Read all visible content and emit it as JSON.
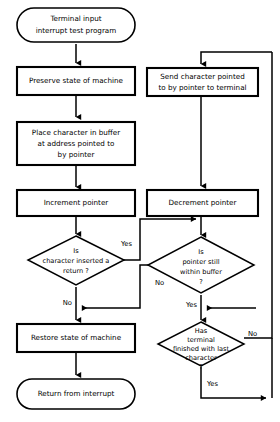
{
  "diagram": {
    "background_color": "#ffffff",
    "line_color": "#000000",
    "nodes": {
      "start": {
        "shape": "terminator",
        "line1": "Terminal input",
        "line2": "interrupt test program"
      },
      "preserve": {
        "shape": "process",
        "line1": "Preserve state of machine"
      },
      "place_char": {
        "shape": "process",
        "line1": "Place character in buffer",
        "line2": "at address pointed to",
        "line3": "by pointer"
      },
      "increment": {
        "shape": "process",
        "line1": "Increment pointer"
      },
      "is_return": {
        "shape": "decision",
        "line1": "Is",
        "line2": "character inserted a",
        "line3": "return ?"
      },
      "restore": {
        "shape": "process",
        "line1": "Restore state of machine"
      },
      "return_interrupt": {
        "shape": "terminator",
        "line1": "Return from interrupt"
      },
      "send_char": {
        "shape": "process",
        "line1": "Send character pointed",
        "line2": "to by pointer to terminal"
      },
      "decrement": {
        "shape": "process",
        "line1": "Decrement pointer"
      },
      "within_buffer": {
        "shape": "decision",
        "line1": "Is",
        "line2": "pointer still",
        "line3": "within buffer",
        "line4": "?"
      },
      "terminal_finished": {
        "shape": "decision",
        "line1": "Has",
        "line2": "terminal",
        "line3": "finished with last",
        "line4": "character",
        "line5": "?"
      }
    },
    "edge_labels": {
      "is_return_yes": "Yes",
      "is_return_no": "No",
      "within_buffer_no": "No",
      "within_buffer_yes": "Yes",
      "terminal_finished_no": "No",
      "terminal_finished_yes": "Yes"
    }
  }
}
